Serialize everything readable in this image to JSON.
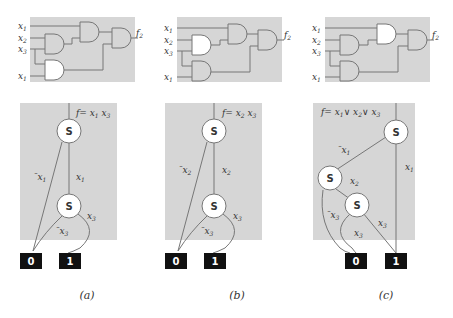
{
  "colors": {
    "panel_bg": "#d6d6d6",
    "wire": "#777777",
    "gate_fill": "#d6d6d6",
    "gate_highlight": "#ffffff",
    "terminal_bg": "#111111"
  },
  "panels": [
    {
      "caption": "(a)",
      "circuit": {
        "inputs": [
          "x1",
          "x2",
          "x3",
          "x1"
        ],
        "output": "f2",
        "highlighted_gate": "lower-left"
      },
      "bdd": {
        "formula": "f= x1 x3",
        "node_label": "S",
        "edges": [
          {
            "label": "¯x1"
          },
          {
            "label": "x1"
          },
          {
            "label": "x3"
          },
          {
            "label": "¯x3"
          }
        ],
        "terminals": [
          "0",
          "1"
        ]
      }
    },
    {
      "caption": "(b)",
      "circuit": {
        "inputs": [
          "x1",
          "x2",
          "x3",
          "x1"
        ],
        "output": "f2",
        "highlighted_gate": "upper-left"
      },
      "bdd": {
        "formula": "f= x2 x3",
        "node_label": "S",
        "edges": [
          {
            "label": "¯x2"
          },
          {
            "label": "x2"
          },
          {
            "label": "x3"
          },
          {
            "label": "¯x3"
          }
        ],
        "terminals": [
          "0",
          "1"
        ]
      }
    },
    {
      "caption": "(c)",
      "circuit": {
        "inputs": [
          "x1",
          "x2",
          "x3",
          "x1"
        ],
        "output": "f2",
        "highlighted_gate": "upper-middle"
      },
      "bdd": {
        "formula": "f= x1∨ x2∨ x3",
        "node_label": "S",
        "edges": [
          {
            "label": "¯x1"
          },
          {
            "label": "x1"
          },
          {
            "label": "x2"
          },
          {
            "label": "¯x3"
          },
          {
            "label": "x3"
          },
          {
            "label": "x3"
          }
        ],
        "terminals": [
          "0",
          "1"
        ]
      }
    }
  ]
}
